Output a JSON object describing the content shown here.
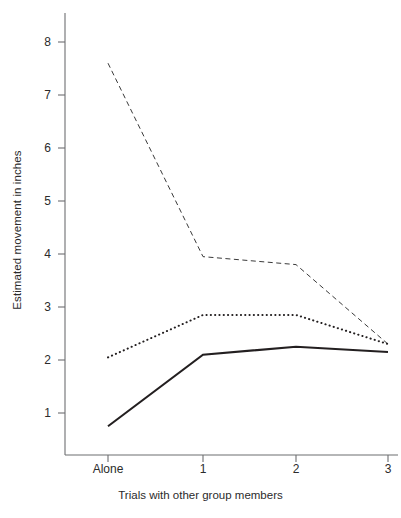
{
  "chart_data": {
    "type": "line",
    "title": "",
    "xlabel": "Trials with other group members",
    "ylabel": "Estimated movement in inches",
    "categories": [
      "Alone",
      "1",
      "2",
      "3"
    ],
    "x_tick_labels": [
      "Alone",
      "1",
      "2",
      "3"
    ],
    "y_tick_labels": [
      "1",
      "2",
      "3",
      "4",
      "5",
      "6",
      "7",
      "8"
    ],
    "y_ticks": [
      1,
      2,
      3,
      4,
      5,
      6,
      7,
      8
    ],
    "ylim": [
      0.2,
      8.4
    ],
    "grid": false,
    "legend": "none",
    "axis_color": "#6d6e71",
    "series": [
      {
        "name": "dashed-series",
        "style": "dashed",
        "color": "#3a3a3a",
        "values": [
          7.6,
          3.95,
          3.8,
          2.3
        ]
      },
      {
        "name": "dotted-series",
        "style": "dotted",
        "color": "#231f20",
        "values": [
          2.05,
          2.85,
          2.85,
          2.3
        ]
      },
      {
        "name": "solid-series",
        "style": "solid",
        "color": "#231f20",
        "values": [
          0.75,
          2.1,
          2.25,
          2.15
        ]
      }
    ]
  },
  "axes": {
    "y_label_text": "Estimated movement in inches",
    "x_label_text": "Trials with other group members"
  }
}
